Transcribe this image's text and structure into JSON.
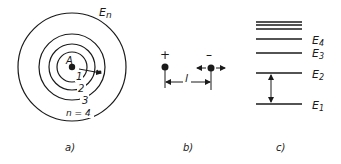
{
  "panels": {
    "a": {
      "caption": "a)",
      "nucleus_label": "A",
      "orbit_labels": [
        "1",
        "2",
        "3",
        "n = 4"
      ],
      "energy_label_main": "E",
      "energy_label_sub": "n"
    },
    "b": {
      "caption": "b)",
      "positive_sign": "+",
      "negative_sign": "–",
      "distance_label": "l"
    },
    "c": {
      "caption": "c)",
      "levels": [
        {
          "main": "E",
          "sub": "4"
        },
        {
          "main": "E",
          "sub": "3"
        },
        {
          "main": "E",
          "sub": "2"
        },
        {
          "main": "E",
          "sub": "1"
        }
      ]
    }
  },
  "colors": {
    "ink": "#1a1a1a",
    "background": "#ffffff"
  }
}
